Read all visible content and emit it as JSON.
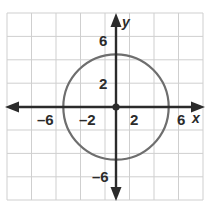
{
  "chart_data": {
    "type": "scatter",
    "title": "",
    "xlabel": "x",
    "ylabel": "y",
    "xlim": [
      -7.3,
      7.6
    ],
    "ylim": [
      -7.6,
      7.3
    ],
    "grid": true,
    "grid_step": 2,
    "legend": "none",
    "shapes": [
      {
        "kind": "circle",
        "center_x": 0,
        "center_y": 0,
        "radius": 4.4,
        "color": "#6e6e6e"
      },
      {
        "kind": "point",
        "x": 0,
        "y": 0,
        "color": "#2b2b2b",
        "label": "origin"
      }
    ],
    "x_ticks": [
      {
        "value": -6,
        "label": "–6"
      },
      {
        "value": -2,
        "label": "–2"
      },
      {
        "value": 2,
        "label": "2"
      },
      {
        "value": 6,
        "label": "6"
      }
    ],
    "y_ticks": [
      {
        "value": 6,
        "label": "6"
      },
      {
        "value": 2,
        "label": "2"
      },
      {
        "value": -6,
        "label": "–6"
      }
    ]
  },
  "axes": {
    "x_name": "x",
    "y_name": "y"
  },
  "labels": {
    "x_neg6": "–6",
    "x_neg2": "–2",
    "x_pos2": "2",
    "x_pos6": "6",
    "y_pos6": "6",
    "y_pos2": "2",
    "y_neg6": "–6"
  },
  "colors": {
    "grid": "#cfcfcf",
    "axis": "#2b2b2b",
    "curve": "#6e6e6e",
    "text": "#2b2b2b",
    "background": "#ffffff"
  }
}
